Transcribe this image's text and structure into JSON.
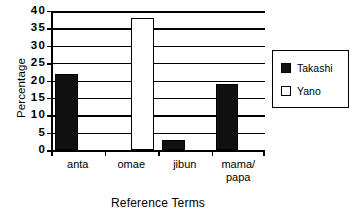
{
  "chart_data": {
    "type": "bar",
    "title": "",
    "xlabel": "Reference Terms",
    "ylabel": "Percentage",
    "categories": [
      "anta",
      "omae",
      "jibun",
      "mama/papa"
    ],
    "category_lines": [
      [
        "anta"
      ],
      [
        "omae"
      ],
      [
        "jibun"
      ],
      [
        "mama/",
        "papa"
      ]
    ],
    "series": [
      {
        "name": "Takashi",
        "color": "#111111",
        "values": [
          22,
          0,
          3,
          19
        ]
      },
      {
        "name": "Yano",
        "color": "#ffffff",
        "values": [
          0,
          38,
          0,
          0
        ]
      }
    ],
    "ylim": [
      0,
      40
    ],
    "yticks": [
      0,
      5,
      10,
      15,
      20,
      25,
      30,
      35,
      40
    ],
    "ytick_labels": [
      "0",
      "5",
      "10",
      "15",
      "20",
      "25",
      "30",
      "35",
      "40"
    ],
    "grid": true,
    "grid_axis": "y",
    "legend_position": "right",
    "legend_entries": [
      {
        "label": "Takashi",
        "swatch": "filled"
      },
      {
        "label": "Yano",
        "swatch": "hollow"
      }
    ]
  }
}
